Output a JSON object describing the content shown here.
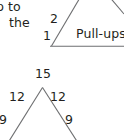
{
  "document": {
    "background_color": "#ffffff",
    "ink_color": "#231f20",
    "rule_color": "#6d6e70"
  },
  "text_fragment": {
    "line_1": "p to",
    "line_2": "the"
  },
  "top_figure": {
    "name": "pull-ups-triangle-figure",
    "caption": "Pull-ups",
    "left_upper_label": "2",
    "left_lower_label": "1",
    "strokes": {
      "baseline": "horizontal rule along figure base",
      "left_slant": "diagonal rising to the right",
      "right_slant": "diagonal descending to the right"
    }
  },
  "bottom_figure": {
    "name": "branching-number-tree",
    "apex_value": "15",
    "branch_values": [
      "12",
      "12"
    ],
    "lower_values": [
      "9",
      "9"
    ],
    "strokes": {
      "left_branch": "diagonal from apex down-left past the page edge",
      "right_branch": "diagonal from apex down-right past the page edge"
    }
  }
}
